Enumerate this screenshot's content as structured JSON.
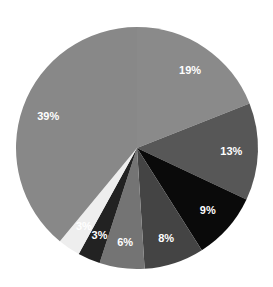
{
  "chart_data": {
    "type": "pie",
    "title": "",
    "start_angle_deg": 0,
    "direction": "clockwise",
    "center": [
      137,
      148
    ],
    "radius": 121,
    "slices": [
      {
        "label": "19%",
        "value": 19,
        "color": "#8a8a8a"
      },
      {
        "label": "13%",
        "value": 13,
        "color": "#575757"
      },
      {
        "label": "9%",
        "value": 9,
        "color": "#0a0a0a"
      },
      {
        "label": "8%",
        "value": 8,
        "color": "#444444"
      },
      {
        "label": "6%",
        "value": 6,
        "color": "#747474"
      },
      {
        "label": "3%",
        "value": 3,
        "color": "#222222"
      },
      {
        "label": "3%",
        "value": 3,
        "color": "#eeeeee"
      },
      {
        "label": "39%",
        "value": 39,
        "color": "#888888"
      }
    ],
    "legend": null
  }
}
